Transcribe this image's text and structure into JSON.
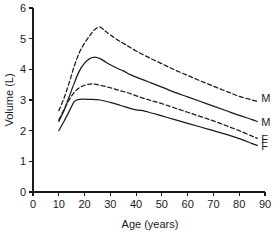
{
  "chart_data": {
    "type": "line",
    "title": "",
    "xlabel": "Age (years)",
    "ylabel": "Volume (L)",
    "xlim": [
      0,
      90
    ],
    "ylim": [
      0,
      6
    ],
    "xticks": [
      0,
      10,
      20,
      30,
      40,
      50,
      60,
      70,
      80,
      90
    ],
    "yticks": [
      0,
      1,
      2,
      3,
      4,
      5,
      6
    ],
    "xtick_labels": [
      "0",
      "10",
      "20",
      "30",
      "40",
      "50",
      "60",
      "70",
      "80",
      "90"
    ],
    "ytick_labels": [
      "0",
      "1",
      "2",
      "3",
      "4",
      "5",
      "6"
    ],
    "grid": false,
    "legend_position": "right-end-labels",
    "line_color": "#1a1a1a",
    "background": "#ffffff",
    "series": [
      {
        "name": "M",
        "label": "M",
        "style": "dashed",
        "label_value": 3.05,
        "x": [
          10,
          12,
          14,
          16,
          18,
          20,
          22,
          24,
          26,
          28,
          30,
          33,
          36,
          40,
          45,
          50,
          55,
          60,
          65,
          70,
          75,
          80,
          85,
          87
        ],
        "values": [
          2.65,
          3.05,
          3.55,
          4.1,
          4.55,
          4.85,
          5.1,
          5.3,
          5.38,
          5.25,
          5.12,
          4.95,
          4.8,
          4.6,
          4.38,
          4.18,
          3.98,
          3.8,
          3.62,
          3.45,
          3.28,
          3.12,
          3.0,
          2.96
        ]
      },
      {
        "name": "M",
        "label": "M",
        "style": "solid",
        "label_value": 2.28,
        "x": [
          10,
          12,
          14,
          16,
          18,
          20,
          22,
          24,
          26,
          28,
          30,
          33,
          35,
          38,
          42,
          46,
          50,
          55,
          60,
          65,
          70,
          75,
          80,
          85,
          87
        ],
        "values": [
          2.3,
          2.65,
          3.1,
          3.55,
          3.95,
          4.2,
          4.35,
          4.4,
          4.35,
          4.25,
          4.15,
          4.02,
          3.95,
          3.82,
          3.68,
          3.55,
          3.42,
          3.25,
          3.1,
          2.95,
          2.8,
          2.65,
          2.5,
          2.36,
          2.3
        ]
      },
      {
        "name": "F",
        "label": "F",
        "style": "dashed",
        "label_value": 1.72,
        "x": [
          10,
          12,
          14,
          16,
          18,
          20,
          22,
          24,
          26,
          30,
          34,
          38,
          42,
          46,
          50,
          55,
          60,
          65,
          70,
          75,
          80,
          85,
          87
        ],
        "values": [
          2.35,
          2.68,
          3.0,
          3.25,
          3.4,
          3.48,
          3.52,
          3.52,
          3.48,
          3.4,
          3.3,
          3.2,
          3.08,
          2.98,
          2.88,
          2.74,
          2.6,
          2.46,
          2.32,
          2.16,
          2.0,
          1.82,
          1.75
        ]
      },
      {
        "name": "F",
        "label": "F",
        "style": "solid",
        "label_value": 1.5,
        "x": [
          10,
          12,
          14,
          16,
          18,
          22,
          26,
          30,
          34,
          38,
          40,
          42,
          45,
          50,
          55,
          60,
          65,
          70,
          75,
          80,
          85,
          87
        ],
        "values": [
          2.0,
          2.3,
          2.62,
          2.95,
          3.02,
          3.02,
          3.0,
          2.92,
          2.82,
          2.72,
          2.68,
          2.66,
          2.6,
          2.48,
          2.36,
          2.24,
          2.12,
          2.0,
          1.88,
          1.74,
          1.58,
          1.52
        ]
      }
    ]
  }
}
